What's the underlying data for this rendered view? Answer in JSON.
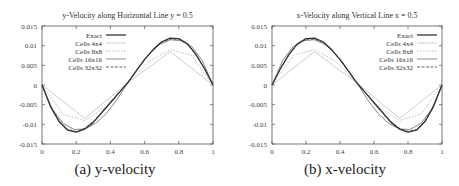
{
  "chart_data": [
    {
      "type": "line",
      "title": "y-Velocity along Horizontal Line y = 0.5",
      "caption": "(a) y-velocity",
      "xlabel": "",
      "ylabel": "",
      "xlim": [
        0,
        1
      ],
      "ylim": [
        -0.015,
        0.015
      ],
      "xticks": [
        "0",
        "0.2",
        "0.4",
        "0.6",
        "0.8",
        "1"
      ],
      "yticks": [
        "0.015",
        "0.01",
        "0.005",
        "0",
        "-0.005",
        "-0.01",
        "-0.015"
      ],
      "grid": false,
      "legend_position": "top-left",
      "series": [
        {
          "name": "Exact",
          "x": [
            0,
            0.05,
            0.1,
            0.15,
            0.2,
            0.25,
            0.3,
            0.35,
            0.4,
            0.45,
            0.5,
            0.55,
            0.6,
            0.65,
            0.7,
            0.75,
            0.8,
            0.85,
            0.9,
            0.95,
            1
          ],
          "values": [
            0,
            -0.0055,
            -0.0093,
            -0.0115,
            -0.012,
            -0.0112,
            -0.0095,
            -0.007,
            -0.0045,
            -0.002,
            0.0005,
            0.0035,
            0.0065,
            0.009,
            0.011,
            0.0119,
            0.0118,
            0.0105,
            0.0078,
            0.0042,
            0
          ]
        },
        {
          "name": "Cells 4x4",
          "x": [
            0,
            0.25,
            0.5,
            0.75,
            1
          ],
          "values": [
            0,
            -0.0085,
            0.0005,
            0.0085,
            0
          ]
        },
        {
          "name": "Cells 8x8",
          "x": [
            0,
            0.125,
            0.25,
            0.375,
            0.5,
            0.625,
            0.75,
            0.875,
            1
          ],
          "values": [
            0,
            -0.0075,
            -0.009,
            -0.0055,
            0.0005,
            0.006,
            0.009,
            0.0075,
            0
          ]
        },
        {
          "name": "Cells 16x16",
          "x": [
            0,
            0.0625,
            0.125,
            0.1875,
            0.25,
            0.3125,
            0.375,
            0.4375,
            0.5,
            0.5625,
            0.625,
            0.6875,
            0.75,
            0.8125,
            0.875,
            0.9375,
            1
          ],
          "values": [
            0,
            -0.0063,
            -0.0098,
            -0.0113,
            -0.0112,
            -0.0098,
            -0.0073,
            -0.0038,
            0.0005,
            0.0043,
            0.0078,
            0.0103,
            0.0115,
            0.0113,
            0.0098,
            0.0062,
            0
          ]
        },
        {
          "name": "Cells 32x32",
          "x": [
            0,
            0.05,
            0.1,
            0.15,
            0.2,
            0.25,
            0.3,
            0.35,
            0.4,
            0.45,
            0.5,
            0.55,
            0.6,
            0.65,
            0.7,
            0.75,
            0.8,
            0.85,
            0.9,
            0.95,
            1
          ],
          "values": [
            0,
            -0.0054,
            -0.0091,
            -0.0113,
            -0.0118,
            -0.011,
            -0.0093,
            -0.0069,
            -0.0044,
            -0.0019,
            0.0005,
            0.0035,
            0.0064,
            0.0089,
            0.0108,
            0.0117,
            0.0116,
            0.0103,
            0.0077,
            0.0041,
            0
          ]
        }
      ]
    },
    {
      "type": "line",
      "title": "x-Velocity along Vertical Line x = 0.5",
      "caption": "(b) x-velocity",
      "xlabel": "",
      "ylabel": "",
      "xlim": [
        0,
        1
      ],
      "ylim": [
        -0.015,
        0.015
      ],
      "xticks": [
        "0",
        "0.2",
        "0.4",
        "0.6",
        "0.8",
        "1"
      ],
      "yticks": [
        "0.015",
        "0.01",
        "0.005",
        "0",
        "-0.005",
        "-0.01",
        "-0.015"
      ],
      "grid": false,
      "legend_position": "top-right",
      "series": [
        {
          "name": "Exact",
          "x": [
            0,
            0.05,
            0.1,
            0.15,
            0.2,
            0.25,
            0.3,
            0.35,
            0.4,
            0.45,
            0.5,
            0.55,
            0.6,
            0.65,
            0.7,
            0.75,
            0.8,
            0.85,
            0.9,
            0.95,
            1
          ],
          "values": [
            0,
            0.0042,
            0.0078,
            0.0105,
            0.0118,
            0.0119,
            0.011,
            0.009,
            0.0065,
            0.0035,
            0.0005,
            -0.002,
            -0.0045,
            -0.007,
            -0.0095,
            -0.0112,
            -0.012,
            -0.0115,
            -0.0093,
            -0.0055,
            0
          ]
        },
        {
          "name": "Cells 4x4",
          "x": [
            0,
            0.25,
            0.5,
            0.75,
            1
          ],
          "values": [
            0,
            0.0085,
            0.0005,
            -0.0085,
            0
          ]
        },
        {
          "name": "Cells 8x8",
          "x": [
            0,
            0.125,
            0.25,
            0.375,
            0.5,
            0.625,
            0.75,
            0.875,
            1
          ],
          "values": [
            0,
            0.0075,
            0.009,
            0.006,
            0.0005,
            -0.0055,
            -0.009,
            -0.0075,
            0
          ]
        },
        {
          "name": "Cells 16x16",
          "x": [
            0,
            0.0625,
            0.125,
            0.1875,
            0.25,
            0.3125,
            0.375,
            0.4375,
            0.5,
            0.5625,
            0.625,
            0.6875,
            0.75,
            0.8125,
            0.875,
            0.9375,
            1
          ],
          "values": [
            0,
            0.0062,
            0.0098,
            0.0113,
            0.0115,
            0.0103,
            0.0078,
            0.0043,
            0.0005,
            -0.0038,
            -0.0073,
            -0.0098,
            -0.0112,
            -0.0113,
            -0.0098,
            -0.0063,
            0
          ]
        },
        {
          "name": "Cells 32x32",
          "x": [
            0,
            0.05,
            0.1,
            0.15,
            0.2,
            0.25,
            0.3,
            0.35,
            0.4,
            0.45,
            0.5,
            0.55,
            0.6,
            0.65,
            0.7,
            0.75,
            0.8,
            0.85,
            0.9,
            0.95,
            1
          ],
          "values": [
            0,
            0.0041,
            0.0077,
            0.0103,
            0.0116,
            0.0117,
            0.0108,
            0.0089,
            0.0064,
            0.0035,
            0.0005,
            -0.0019,
            -0.0044,
            -0.0069,
            -0.0093,
            -0.011,
            -0.0118,
            -0.0113,
            -0.0091,
            -0.0054,
            0
          ]
        }
      ]
    }
  ],
  "styles": {
    "Exact": {
      "color": "#333333",
      "width": 1.3,
      "dash": ""
    },
    "Cells 4x4": {
      "color": "#cfcfcf",
      "width": 1,
      "dash": ""
    },
    "Cells 8x8": {
      "color": "#bdbdbd",
      "width": 1,
      "dash": "1.5,1.5"
    },
    "Cells 16x16": {
      "color": "#8a8a8a",
      "width": 1,
      "dash": ""
    },
    "Cells 32x32": {
      "color": "#555555",
      "width": 0.9,
      "dash": "3,1.5"
    }
  }
}
